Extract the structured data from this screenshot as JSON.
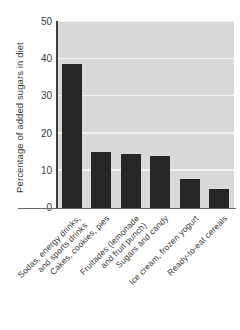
{
  "chart_data": {
    "type": "bar",
    "title": "",
    "xlabel": "",
    "ylabel": "Percentage of added sugars in diet",
    "ylim": [
      0,
      50
    ],
    "yticks": [
      "0",
      "10",
      "20",
      "30",
      "40",
      "50"
    ],
    "grid": true,
    "legend": null,
    "categories": [
      "Sodas, energy drinks, and sports drinks",
      "Cakes, cookies, pies",
      "Fruitades (lemonade and fruit punch)",
      "Sugars and candy",
      "Ice cream, frozen yogurt",
      "Ready-to-eat cereals"
    ],
    "category_lines": [
      [
        "Sodas, energy drinks,",
        "and sports drinks"
      ],
      [
        "Cakes, cookies, pies",
        ""
      ],
      [
        "Fruitades (lemonade",
        "and fruit punch)"
      ],
      [
        "Sugars and candy",
        ""
      ],
      [
        "Ice cream, frozen yogurt",
        ""
      ],
      [
        "Ready-to-eat cereals",
        ""
      ]
    ],
    "values": [
      38.8,
      15.1,
      14.5,
      14.0,
      7.8,
      5.1
    ],
    "colors": {
      "bar": "#262626",
      "plot_background": "#d9d9d9",
      "gridline": "#f2f2f2",
      "axis": "#3d3d3d",
      "text": "#3a3a3a",
      "figure_background": "#ffffff"
    }
  },
  "title_sliver": "",
  "ylabel": "Percentage of added sugars in diet"
}
